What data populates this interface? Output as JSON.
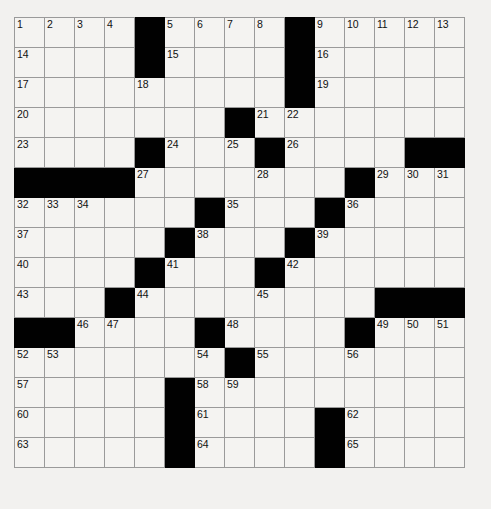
{
  "puzzle": {
    "title": "Crossword Grid",
    "rows": 15,
    "cols": 15,
    "cell_size_px": 31,
    "colors": {
      "background": "#f2f1ef",
      "cell_fill": "#f4f3f1",
      "block_fill": "#010101",
      "grid_line": "#9a9a9a",
      "number_text": "#101010"
    },
    "grid": [
      [
        {
          "n": "1",
          "b": false
        },
        {
          "n": "2",
          "b": false
        },
        {
          "n": "3",
          "b": false
        },
        {
          "n": "4",
          "b": false
        },
        {
          "n": "",
          "b": true
        },
        {
          "n": "5",
          "b": false
        },
        {
          "n": "6",
          "b": false
        },
        {
          "n": "7",
          "b": false
        },
        {
          "n": "8",
          "b": false
        },
        {
          "n": "",
          "b": true
        },
        {
          "n": "9",
          "b": false
        },
        {
          "n": "10",
          "b": false
        },
        {
          "n": "11",
          "b": false
        },
        {
          "n": "12",
          "b": false
        },
        {
          "n": "13",
          "b": false
        }
      ],
      [
        {
          "n": "14",
          "b": false
        },
        {
          "n": "",
          "b": false
        },
        {
          "n": "",
          "b": false
        },
        {
          "n": "",
          "b": false
        },
        {
          "n": "",
          "b": true
        },
        {
          "n": "15",
          "b": false
        },
        {
          "n": "",
          "b": false
        },
        {
          "n": "",
          "b": false
        },
        {
          "n": "",
          "b": false
        },
        {
          "n": "",
          "b": true
        },
        {
          "n": "16",
          "b": false
        },
        {
          "n": "",
          "b": false
        },
        {
          "n": "",
          "b": false
        },
        {
          "n": "",
          "b": false
        },
        {
          "n": "",
          "b": false
        }
      ],
      [
        {
          "n": "17",
          "b": false
        },
        {
          "n": "",
          "b": false
        },
        {
          "n": "",
          "b": false
        },
        {
          "n": "",
          "b": false
        },
        {
          "n": "18",
          "b": false
        },
        {
          "n": "",
          "b": false
        },
        {
          "n": "",
          "b": false
        },
        {
          "n": "",
          "b": false
        },
        {
          "n": "",
          "b": false
        },
        {
          "n": "",
          "b": true
        },
        {
          "n": "19",
          "b": false
        },
        {
          "n": "",
          "b": false
        },
        {
          "n": "",
          "b": false
        },
        {
          "n": "",
          "b": false
        },
        {
          "n": "",
          "b": false
        }
      ],
      [
        {
          "n": "20",
          "b": false
        },
        {
          "n": "",
          "b": false
        },
        {
          "n": "",
          "b": false
        },
        {
          "n": "",
          "b": false
        },
        {
          "n": "",
          "b": false
        },
        {
          "n": "",
          "b": false
        },
        {
          "n": "",
          "b": false
        },
        {
          "n": "",
          "b": true
        },
        {
          "n": "21",
          "b": false
        },
        {
          "n": "22",
          "b": false
        },
        {
          "n": "",
          "b": false
        },
        {
          "n": "",
          "b": false
        },
        {
          "n": "",
          "b": false
        },
        {
          "n": "",
          "b": false
        },
        {
          "n": "",
          "b": false
        }
      ],
      [
        {
          "n": "23",
          "b": false
        },
        {
          "n": "",
          "b": false
        },
        {
          "n": "",
          "b": false
        },
        {
          "n": "",
          "b": false
        },
        {
          "n": "",
          "b": true
        },
        {
          "n": "24",
          "b": false
        },
        {
          "n": "",
          "b": false
        },
        {
          "n": "25",
          "b": false
        },
        {
          "n": "",
          "b": true
        },
        {
          "n": "26",
          "b": false
        },
        {
          "n": "",
          "b": false
        },
        {
          "n": "",
          "b": false
        },
        {
          "n": "",
          "b": false
        },
        {
          "n": "",
          "b": true
        },
        {
          "n": "",
          "b": true
        }
      ],
      [
        {
          "n": "",
          "b": true
        },
        {
          "n": "",
          "b": true
        },
        {
          "n": "",
          "b": true
        },
        {
          "n": "",
          "b": true
        },
        {
          "n": "27",
          "b": false
        },
        {
          "n": "",
          "b": false
        },
        {
          "n": "",
          "b": false
        },
        {
          "n": "",
          "b": false
        },
        {
          "n": "28",
          "b": false
        },
        {
          "n": "",
          "b": false
        },
        {
          "n": "",
          "b": false
        },
        {
          "n": "",
          "b": true
        },
        {
          "n": "29",
          "b": false
        },
        {
          "n": "30",
          "b": false
        },
        {
          "n": "31",
          "b": false
        }
      ],
      [
        {
          "n": "32",
          "b": false
        },
        {
          "n": "33",
          "b": false
        },
        {
          "n": "34",
          "b": false
        },
        {
          "n": "",
          "b": false
        },
        {
          "n": "",
          "b": false
        },
        {
          "n": "",
          "b": false
        },
        {
          "n": "",
          "b": true
        },
        {
          "n": "35",
          "b": false
        },
        {
          "n": "",
          "b": false
        },
        {
          "n": "",
          "b": false
        },
        {
          "n": "",
          "b": true
        },
        {
          "n": "36",
          "b": false
        },
        {
          "n": "",
          "b": false
        },
        {
          "n": "",
          "b": false
        },
        {
          "n": "",
          "b": false
        }
      ],
      [
        {
          "n": "37",
          "b": false
        },
        {
          "n": "",
          "b": false
        },
        {
          "n": "",
          "b": false
        },
        {
          "n": "",
          "b": false
        },
        {
          "n": "",
          "b": false
        },
        {
          "n": "",
          "b": true
        },
        {
          "n": "38",
          "b": false
        },
        {
          "n": "",
          "b": false
        },
        {
          "n": "",
          "b": false
        },
        {
          "n": "",
          "b": true
        },
        {
          "n": "39",
          "b": false
        },
        {
          "n": "",
          "b": false
        },
        {
          "n": "",
          "b": false
        },
        {
          "n": "",
          "b": false
        },
        {
          "n": "",
          "b": false
        }
      ],
      [
        {
          "n": "40",
          "b": false
        },
        {
          "n": "",
          "b": false
        },
        {
          "n": "",
          "b": false
        },
        {
          "n": "",
          "b": false
        },
        {
          "n": "",
          "b": true
        },
        {
          "n": "41",
          "b": false
        },
        {
          "n": "",
          "b": false
        },
        {
          "n": "",
          "b": false
        },
        {
          "n": "",
          "b": true
        },
        {
          "n": "42",
          "b": false
        },
        {
          "n": "",
          "b": false
        },
        {
          "n": "",
          "b": false
        },
        {
          "n": "",
          "b": false
        },
        {
          "n": "",
          "b": false
        },
        {
          "n": "",
          "b": false
        }
      ],
      [
        {
          "n": "43",
          "b": false
        },
        {
          "n": "",
          "b": false
        },
        {
          "n": "",
          "b": false
        },
        {
          "n": "",
          "b": true
        },
        {
          "n": "44",
          "b": false
        },
        {
          "n": "",
          "b": false
        },
        {
          "n": "",
          "b": false
        },
        {
          "n": "",
          "b": false
        },
        {
          "n": "45",
          "b": false
        },
        {
          "n": "",
          "b": false
        },
        {
          "n": "",
          "b": false
        },
        {
          "n": "",
          "b": false
        },
        {
          "n": "",
          "b": true
        },
        {
          "n": "",
          "b": true
        },
        {
          "n": "",
          "b": true
        }
      ],
      [
        {
          "n": "",
          "b": true
        },
        {
          "n": "",
          "b": true
        },
        {
          "n": "46",
          "b": false
        },
        {
          "n": "47",
          "b": false
        },
        {
          "n": "",
          "b": false
        },
        {
          "n": "",
          "b": false
        },
        {
          "n": "",
          "b": true
        },
        {
          "n": "48",
          "b": false
        },
        {
          "n": "",
          "b": false
        },
        {
          "n": "",
          "b": false
        },
        {
          "n": "",
          "b": false
        },
        {
          "n": "",
          "b": true
        },
        {
          "n": "49",
          "b": false
        },
        {
          "n": "50",
          "b": false
        },
        {
          "n": "51",
          "b": false
        }
      ],
      [
        {
          "n": "52",
          "b": false
        },
        {
          "n": "53",
          "b": false
        },
        {
          "n": "",
          "b": false
        },
        {
          "n": "",
          "b": false
        },
        {
          "n": "",
          "b": false
        },
        {
          "n": "",
          "b": false
        },
        {
          "n": "54",
          "b": false
        },
        {
          "n": "",
          "b": true
        },
        {
          "n": "55",
          "b": false
        },
        {
          "n": "",
          "b": false
        },
        {
          "n": "",
          "b": false
        },
        {
          "n": "56",
          "b": false
        },
        {
          "n": "",
          "b": false
        },
        {
          "n": "",
          "b": false
        },
        {
          "n": "",
          "b": false
        }
      ],
      [
        {
          "n": "57",
          "b": false
        },
        {
          "n": "",
          "b": false
        },
        {
          "n": "",
          "b": false
        },
        {
          "n": "",
          "b": false
        },
        {
          "n": "",
          "b": false
        },
        {
          "n": "",
          "b": true
        },
        {
          "n": "58",
          "b": false
        },
        {
          "n": "59",
          "b": false
        },
        {
          "n": "",
          "b": false
        },
        {
          "n": "",
          "b": false
        },
        {
          "n": "",
          "b": false
        },
        {
          "n": "",
          "b": false
        },
        {
          "n": "",
          "b": false
        },
        {
          "n": "",
          "b": false
        },
        {
          "n": "",
          "b": false
        }
      ],
      [
        {
          "n": "60",
          "b": false
        },
        {
          "n": "",
          "b": false
        },
        {
          "n": "",
          "b": false
        },
        {
          "n": "",
          "b": false
        },
        {
          "n": "",
          "b": false
        },
        {
          "n": "",
          "b": true
        },
        {
          "n": "61",
          "b": false
        },
        {
          "n": "",
          "b": false
        },
        {
          "n": "",
          "b": false
        },
        {
          "n": "",
          "b": false
        },
        {
          "n": "",
          "b": true
        },
        {
          "n": "62",
          "b": false
        },
        {
          "n": "",
          "b": false
        },
        {
          "n": "",
          "b": false
        },
        {
          "n": "",
          "b": false
        }
      ],
      [
        {
          "n": "63",
          "b": false
        },
        {
          "n": "",
          "b": false
        },
        {
          "n": "",
          "b": false
        },
        {
          "n": "",
          "b": false
        },
        {
          "n": "",
          "b": false
        },
        {
          "n": "",
          "b": true
        },
        {
          "n": "64",
          "b": false
        },
        {
          "n": "",
          "b": false
        },
        {
          "n": "",
          "b": false
        },
        {
          "n": "",
          "b": false
        },
        {
          "n": "",
          "b": true
        },
        {
          "n": "65",
          "b": false
        },
        {
          "n": "",
          "b": false
        },
        {
          "n": "",
          "b": false
        },
        {
          "n": "",
          "b": false
        }
      ]
    ]
  }
}
